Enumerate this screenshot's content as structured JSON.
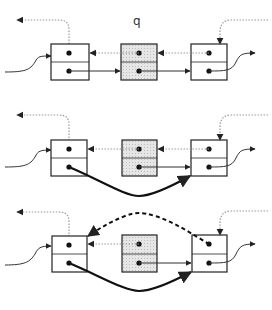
{
  "diagram": {
    "pointer_label": "q",
    "colors": {
      "stroke": "#222222",
      "dotted": "#aaaaaa",
      "removed_fill": "#dddddd",
      "node_fill": "#ffffff"
    },
    "stages": [
      {
        "name": "initial",
        "description": "q points to middle node in list"
      },
      {
        "name": "next-relinked",
        "description": "left node's next pointer bypasses middle node"
      },
      {
        "name": "prev-relinked",
        "description": "right node's prev pointer bypasses middle node (dashed)"
      }
    ]
  }
}
